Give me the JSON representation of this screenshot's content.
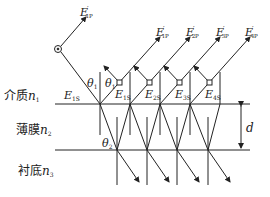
{
  "diagram": {
    "type": "thin-film multiple reflection",
    "colors": {
      "line": "#222222",
      "background": "#ffffff"
    },
    "layers": [
      {
        "name": "介质",
        "symbol": "n",
        "index": "1"
      },
      {
        "name": "薄膜",
        "symbol": "n",
        "index": "2"
      },
      {
        "name": "衬底",
        "symbol": "n",
        "index": "3"
      }
    ],
    "thickness_label": "d",
    "angles": {
      "incident": "θ",
      "incident_sub": "1",
      "refracted": "θ",
      "refracted_sub": "2"
    },
    "incident_wave": {
      "symbol": "E",
      "sub": "1S"
    },
    "reflected_waves": [
      {
        "symbol": "E",
        "prime": "′",
        "sub": "1P"
      },
      {
        "symbol": "E",
        "prime": "′",
        "sub": "1P"
      },
      {
        "symbol": "E",
        "prime": "′",
        "sub": "2P"
      },
      {
        "symbol": "E",
        "prime": "′",
        "sub": "3P"
      },
      {
        "symbol": "E",
        "prime": "′",
        "sub": "4P"
      }
    ],
    "s_components": [
      {
        "symbol": "E",
        "sub": "1S"
      },
      {
        "symbol": "E",
        "sub": "2S"
      },
      {
        "symbol": "E",
        "sub": "3S"
      },
      {
        "symbol": "E",
        "sub": "4S"
      }
    ]
  }
}
